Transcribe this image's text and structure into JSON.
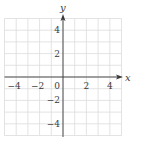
{
  "chart_data": {
    "type": "scatter",
    "title": "",
    "xlabel": "x",
    "ylabel": "y",
    "xlim": [
      -5,
      5
    ],
    "ylim": [
      -5,
      5
    ],
    "grid": true,
    "grid_step": 1,
    "x_ticks": [
      -4,
      -2,
      0,
      2,
      4
    ],
    "x_tick_labels": [
      "−4",
      "−2",
      "0",
      "2",
      "4"
    ],
    "y_ticks": [
      4,
      2,
      -2,
      -4
    ],
    "y_tick_labels": [
      "4",
      "2",
      "−2",
      "−4"
    ],
    "series": [],
    "legend": null
  },
  "colors": {
    "grid": "#dcdcdc",
    "axis": "#3a3a3a",
    "text": "#3a3a3a",
    "background": "#ffffff"
  }
}
